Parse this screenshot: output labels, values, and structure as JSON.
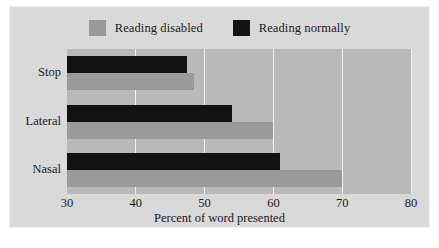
{
  "figure": {
    "background_color": "#d9d9d9",
    "border_color": "#efefef",
    "plot_background_color": "#b9b9b9",
    "gridline_color": "#f2f2f2"
  },
  "legend": {
    "position": "top-center",
    "entries": [
      {
        "label": "Reading disabled",
        "color": "#9a9a9a",
        "swatch_name": "legend-swatch-reading-disabled"
      },
      {
        "label": "Reading normally",
        "color": "#141414",
        "swatch_name": "legend-swatch-reading-normally"
      }
    ]
  },
  "chart_data": {
    "type": "bar",
    "orientation": "horizontal",
    "title": "",
    "xlabel": "Percent of word presented",
    "ylabel": "",
    "xlim": [
      30,
      80
    ],
    "xticks": [
      30,
      40,
      50,
      60,
      70,
      80
    ],
    "xtick_labels": [
      "30",
      "40",
      "50",
      "60",
      "70",
      "80"
    ],
    "categories": [
      "Stop",
      "Lateral",
      "Nasal"
    ],
    "grid": true,
    "grid_axis": "x",
    "legend_position": "top-center",
    "series": [
      {
        "name": "Reading normally",
        "color": "#121212",
        "values": [
          47.5,
          54.0,
          61.0
        ]
      },
      {
        "name": "Reading disabled",
        "color": "#9a9a9a",
        "values": [
          48.5,
          60.0,
          70.0
        ]
      }
    ]
  }
}
